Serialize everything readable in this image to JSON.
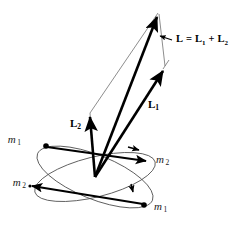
{
  "figure": {
    "background_color": "#ffffff",
    "stroke_color": "#000000",
    "thin_line_color": "#555555",
    "width": 237,
    "height": 226
  },
  "vectors": [
    {
      "id": "L-resultant",
      "label_main": "L",
      "label_sub": "",
      "name": "resultant-angular-momentum",
      "style": "bold",
      "from": [
        95,
        177
      ],
      "to": [
        158,
        12
      ]
    },
    {
      "id": "L1",
      "label_main": "L",
      "label_sub": "1",
      "name": "angular-momentum-1",
      "style": "bold",
      "from": [
        95,
        177
      ],
      "to": [
        164,
        67
      ]
    },
    {
      "id": "L2",
      "label_main": "L",
      "label_sub": "2",
      "name": "angular-momentum-2",
      "style": "bold",
      "from": [
        95,
        177
      ],
      "to": [
        90,
        114
      ]
    }
  ],
  "equation": {
    "lhs": "L",
    "equals": "=",
    "term1_main": "L",
    "term1_sub": "1",
    "plus": "+",
    "term2_main": "L",
    "term2_sub": "2",
    "full_text": "L = L1 + L2"
  },
  "vector_labels": {
    "L1_main": "L",
    "L1_sub": "1",
    "L2_main": "L",
    "L2_sub": "2"
  },
  "masses": [
    {
      "id": "m1-upper-left",
      "main": "m",
      "sub": "1",
      "position": [
        21,
        140
      ],
      "dot": [
        46,
        146
      ],
      "orbit": "orbit-1"
    },
    {
      "id": "m2-right",
      "main": "m",
      "sub": "2",
      "position": [
        156,
        160
      ],
      "dot": [
        147,
        161
      ],
      "orbit": "orbit-1"
    },
    {
      "id": "m2-lower-left",
      "main": "m",
      "sub": "2",
      "position": [
        10,
        183
      ],
      "dot": [
        30,
        186
      ],
      "orbit": "orbit-2"
    },
    {
      "id": "m1-bottom-right",
      "main": "m",
      "sub": "1",
      "position": [
        155,
        207
      ],
      "dot": [
        144,
        205
      ],
      "orbit": "orbit-2"
    }
  ],
  "orbits": [
    {
      "id": "orbit-1",
      "name": "orbital-ellipse-1",
      "center": [
        95,
        177
      ],
      "rx": 62,
      "ry": 20,
      "rotation_deg": -14
    },
    {
      "id": "orbit-2",
      "name": "orbital-ellipse-2",
      "center": [
        95,
        177
      ],
      "rx": 62,
      "ry": 22,
      "rotation_deg": 22
    }
  ],
  "construction": {
    "name": "parallelogram-construction",
    "visible": true,
    "description": "thin lines completing the parallelogram from vector tips to resultant apex"
  }
}
